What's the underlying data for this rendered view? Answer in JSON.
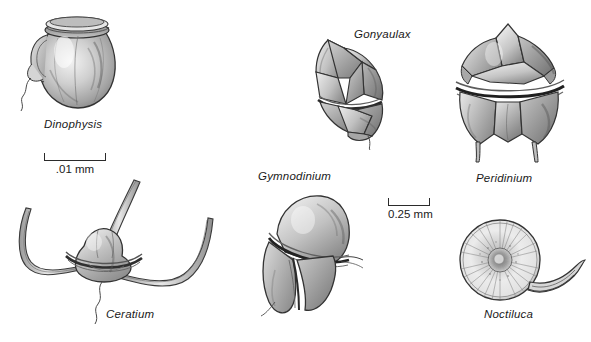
{
  "figure": {
    "background_color": "#ffffff",
    "ink_color": "#2b2b2b",
    "label_color": "#1a1a1a",
    "style": "grayscale scientific line-and-stipple illustration plate"
  },
  "organisms": [
    {
      "id": "dinophysis",
      "label": "Dinophysis",
      "icon": "dinophysis-illustration",
      "x": 14,
      "y": 4,
      "width": 122,
      "height": 112,
      "label_x": 44,
      "label_y": 118
    },
    {
      "id": "ceratium",
      "label": "Ceratium",
      "icon": "ceratium-illustration",
      "x": 2,
      "y": 178,
      "width": 232,
      "height": 150,
      "label_x": 106,
      "label_y": 308
    },
    {
      "id": "gonyaulax",
      "label": "Gonyaulax",
      "icon": "gonyaulax-illustration",
      "x": 298,
      "y": 32,
      "width": 108,
      "height": 118,
      "label_x": 354,
      "label_y": 28
    },
    {
      "id": "gymnodinium",
      "label": "Gymnodinium",
      "icon": "gymnodinium-illustration",
      "x": 255,
      "y": 186,
      "width": 115,
      "height": 132,
      "label_x": 258,
      "label_y": 170
    },
    {
      "id": "peridinium",
      "label": "Peridinium",
      "icon": "peridinium-illustration",
      "x": 446,
      "y": 18,
      "width": 130,
      "height": 150,
      "label_x": 476,
      "label_y": 172
    },
    {
      "id": "noctiluca",
      "label": "Noctiluca",
      "icon": "noctiluca-illustration",
      "x": 452,
      "y": 216,
      "width": 134,
      "height": 90,
      "label_x": 484,
      "label_y": 308
    }
  ],
  "scale_bars": [
    {
      "id": "scale-dinophysis",
      "caption": ".01 mm",
      "x": 44,
      "y": 153,
      "width": 62
    },
    {
      "id": "scale-gymnodinium",
      "caption": "0.25 mm",
      "x": 388,
      "y": 198,
      "width": 42
    }
  ],
  "corner_mark": {
    "text": ""
  }
}
